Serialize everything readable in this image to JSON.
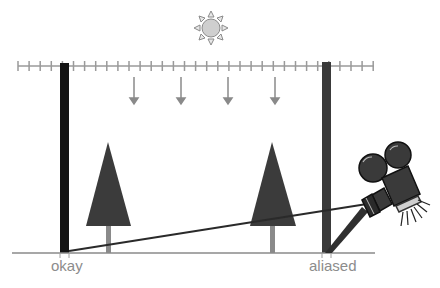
{
  "diagram": {
    "labels": {
      "left_bar": "okay",
      "right_bar": "aliased"
    },
    "colors": {
      "left_bar": "#141414",
      "right_bar": "#3a3a3a",
      "trees": "#3b3b3b",
      "tree_trunk": "#8a8a8a",
      "ground": "#8a8a8a",
      "ruler": "#9a9a9a",
      "arrows": "#8a8a8a",
      "sun_fill": "#cfcfcf",
      "sun_stroke": "#8a8a8a",
      "sight_line": "#2a2a2a",
      "camera": "#3a3a3a",
      "label_text": "#8c8c8c"
    },
    "icons": [
      "sun-icon",
      "tree-icon",
      "tree-icon",
      "movie-camera-icon",
      "down-arrow-icon"
    ]
  }
}
